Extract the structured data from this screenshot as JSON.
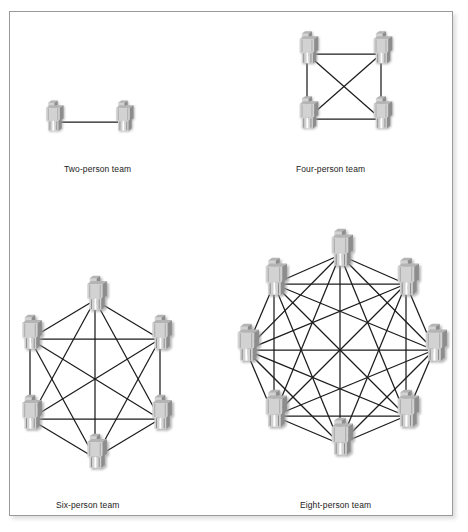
{
  "figure": {
    "background_color": "#ffffff",
    "frame_color": "#9a9a9a",
    "link_color": "#1c1c1c",
    "node_body_color": "#d2d2d2",
    "node_side_color": "#8d8d8d",
    "node_shadow_color": "#bdbdbd",
    "label_color": "#1a1a1a"
  },
  "panels": [
    {
      "id": "two-person",
      "label": "Two-person team",
      "label_x": 64,
      "label_y": 164,
      "member_count": 2,
      "link_count": 1,
      "layout": "line",
      "center_x": 88,
      "center_y": 122,
      "radius": 0,
      "icon_scale": 0.62,
      "nodes": [
        {
          "x": 53,
          "y": 122
        },
        {
          "x": 123,
          "y": 122
        }
      ]
    },
    {
      "id": "four-person",
      "label": "Four-person team",
      "label_x": 296,
      "label_y": 164,
      "member_count": 4,
      "link_count": 6,
      "layout": "square",
      "center_x": 340,
      "center_y": 83,
      "radius": 45,
      "icon_scale": 0.66,
      "nodes": [
        {
          "x": 307,
          "y": 54
        },
        {
          "x": 381,
          "y": 54
        },
        {
          "x": 307,
          "y": 119
        },
        {
          "x": 381,
          "y": 119
        }
      ]
    },
    {
      "id": "six-person",
      "label": "Six-person team",
      "label_x": 56,
      "label_y": 500,
      "member_count": 6,
      "link_count": 15,
      "layout": "hexagon",
      "center_x": 95,
      "center_y": 380,
      "radius": 68,
      "icon_scale": 0.7,
      "nodes": [
        {
          "x": 95,
          "y": 300
        },
        {
          "x": 160,
          "y": 339
        },
        {
          "x": 160,
          "y": 419
        },
        {
          "x": 95,
          "y": 458
        },
        {
          "x": 30,
          "y": 419
        },
        {
          "x": 30,
          "y": 339
        }
      ]
    },
    {
      "id": "eight-person",
      "label": "Eight-person team",
      "label_x": 300,
      "label_y": 500,
      "member_count": 8,
      "link_count": 28,
      "layout": "octagon",
      "center_x": 340,
      "center_y": 355,
      "radius": 92,
      "icon_scale": 0.76,
      "nodes": [
        {
          "x": 340,
          "y": 255
        },
        {
          "x": 406,
          "y": 284
        },
        {
          "x": 434,
          "y": 350
        },
        {
          "x": 406,
          "y": 416
        },
        {
          "x": 340,
          "y": 444
        },
        {
          "x": 274,
          "y": 416
        },
        {
          "x": 246,
          "y": 350
        },
        {
          "x": 274,
          "y": 284
        }
      ]
    }
  ],
  "chart_data": {
    "type": "diagram",
    "subtype": "complete-graph-network",
    "series": [
      {
        "name": "Two-person team",
        "members": 2,
        "channels": 1
      },
      {
        "name": "Four-person team",
        "members": 4,
        "channels": 6
      },
      {
        "name": "Six-person team",
        "members": 6,
        "channels": 15
      },
      {
        "name": "Eight-person team",
        "members": 8,
        "channels": 28
      }
    ],
    "categories": [
      "Two-person team",
      "Four-person team",
      "Six-person team",
      "Eight-person team"
    ],
    "values": [
      1,
      6,
      15,
      28
    ],
    "xlabel": "",
    "ylabel": "",
    "legend": []
  }
}
